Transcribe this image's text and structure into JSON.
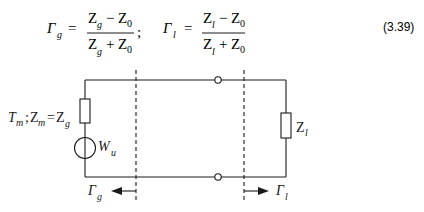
{
  "equation": {
    "gamma_g": {
      "symbol": "Γ",
      "sub": "g"
    },
    "gamma_l": {
      "symbol": "Γ",
      "sub": "l"
    },
    "equals": "=",
    "separator": ";",
    "frac_g": {
      "num": {
        "a": "Z",
        "a_sub": "g",
        "op": "−",
        "b": "Z",
        "b_sub": "0"
      },
      "den": {
        "a": "Z",
        "a_sub": "g",
        "op": "+",
        "b": "Z",
        "b_sub": "0"
      }
    },
    "frac_l": {
      "num": {
        "a": "Z",
        "a_sub": "l",
        "op": "−",
        "b": "Z",
        "b_sub": "0"
      },
      "den": {
        "a": "Z",
        "a_sub": "l",
        "op": "+",
        "b": "Z",
        "b_sub": "0"
      }
    },
    "number": "(3.39)"
  },
  "circuit": {
    "source_impedance_label": {
      "t": "T",
      "t_sub": "m",
      "sep": "; ",
      "z": "Z",
      "z_sub": "m",
      "eq": "=",
      "zg": "Z",
      "zg_sub": "g"
    },
    "source_label": {
      "w": "W",
      "w_sub": "u"
    },
    "load_label": {
      "z": "Z",
      "z_sub": "l"
    },
    "gamma_g_label": {
      "symbol": "Γ",
      "sub": "g"
    },
    "gamma_l_label": {
      "symbol": "Γ",
      "sub": "l"
    }
  }
}
